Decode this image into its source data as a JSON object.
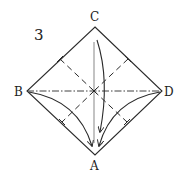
{
  "step_number": "3",
  "labels": {
    "top": "C",
    "left": "B",
    "right": "D",
    "bottom": "A"
  },
  "colors": {
    "line": "#2a2a2a",
    "background": "#ffffff"
  },
  "instructions": {
    "valley_folds": "dashed lines across each half",
    "mountain_fold": "dash-dot line B to D",
    "arrows": [
      "B to A",
      "C to A",
      "D to A"
    ]
  }
}
